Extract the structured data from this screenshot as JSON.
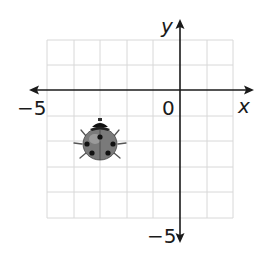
{
  "figure": {
    "type": "coordinate-plane",
    "grid": {
      "x_min": -5,
      "x_max": 2,
      "y_min": -5,
      "y_max": 2,
      "step": 1,
      "color": "#d8d8d8"
    },
    "axes": {
      "x_label": "x",
      "y_label": "y",
      "origin_label": "0",
      "x_min_label": "−5",
      "y_min_label": "−5",
      "color": "#1a1a1a"
    },
    "object": {
      "name": "ladybug",
      "x": -3,
      "y": -2
    }
  }
}
